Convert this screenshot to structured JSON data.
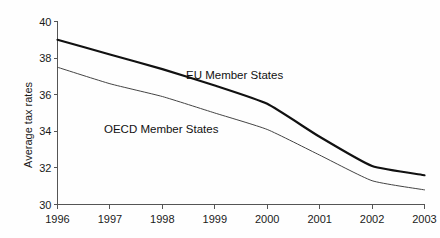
{
  "chart_data": {
    "type": "line",
    "title": "",
    "subtitle": "",
    "xlabel": "",
    "ylabel": "Average tax rates",
    "x": [
      1996,
      1997,
      1998,
      1999,
      2000,
      2001,
      2002,
      2003
    ],
    "xtick_labels": [
      "1996",
      "1997",
      "1998",
      "1999",
      "2000",
      "2001",
      "2002",
      "2003"
    ],
    "ytick_labels": [
      "40",
      "38",
      "36",
      "34",
      "32",
      "30"
    ],
    "yticks": [
      40,
      38,
      36,
      34,
      32,
      30
    ],
    "xlim": [
      1996,
      2003
    ],
    "ylim": [
      30,
      40
    ],
    "grid": false,
    "legend_position": "inline-annotation",
    "series": [
      {
        "name": "EU Member States",
        "color": "#111111",
        "line_width": 2.2,
        "annotation": "EU Member States",
        "values": [
          39.0,
          38.2,
          37.4,
          36.5,
          35.5,
          33.7,
          32.1,
          31.6
        ]
      },
      {
        "name": "OECD Member States",
        "color": "#444444",
        "line_width": 1.0,
        "annotation": "OECD Member States",
        "values": [
          37.5,
          36.6,
          35.9,
          35.0,
          34.1,
          32.7,
          31.3,
          30.8
        ]
      }
    ],
    "annotations": [
      {
        "text": "EU Member States",
        "x_px": 186,
        "y_px": 69
      },
      {
        "text": "OECD Member States",
        "x_px": 104,
        "y_px": 123
      }
    ],
    "axis_color": "#555555",
    "background_color": "#fefefe"
  }
}
